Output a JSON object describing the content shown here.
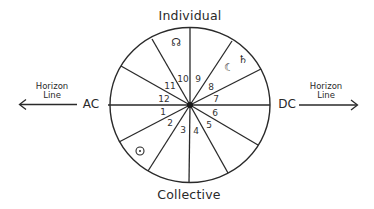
{
  "diagram": {
    "title_top": "Individual",
    "title_bottom": "Collective",
    "left": {
      "angle": "AC",
      "horizon_line1": "Horizon",
      "horizon_line2": "Line"
    },
    "right": {
      "angle": "DC",
      "horizon_line1": "Horizon",
      "horizon_line2": "Line"
    },
    "colors": {
      "stroke": "#2a2a2a",
      "text": "#2a2a2a",
      "background": "#ffffff"
    },
    "circle": {
      "cx": 190,
      "cy": 105,
      "rx": 80,
      "ry": 77.5
    },
    "spokes": [
      {
        "x": 108,
        "y": 105
      },
      {
        "x": 121,
        "y": 66
      },
      {
        "x": 152,
        "y": 39
      },
      {
        "x": 190,
        "y": 28
      },
      {
        "x": 232,
        "y": 41
      },
      {
        "x": 261,
        "y": 69
      },
      {
        "x": 270,
        "y": 105
      },
      {
        "x": 258,
        "y": 145
      },
      {
        "x": 228,
        "y": 173
      },
      {
        "x": 189,
        "y": 183
      },
      {
        "x": 148,
        "y": 171
      },
      {
        "x": 119,
        "y": 142
      }
    ],
    "houses": [
      {
        "num": "1",
        "x": 163,
        "y": 112
      },
      {
        "num": "2",
        "x": 170,
        "y": 123
      },
      {
        "num": "3",
        "x": 183,
        "y": 130
      },
      {
        "num": "4",
        "x": 196,
        "y": 131
      },
      {
        "num": "5",
        "x": 209,
        "y": 125
      },
      {
        "num": "6",
        "x": 215,
        "y": 113
      },
      {
        "num": "7",
        "x": 216,
        "y": 99
      },
      {
        "num": "8",
        "x": 211,
        "y": 87
      },
      {
        "num": "9",
        "x": 198,
        "y": 79
      },
      {
        "num": "10",
        "x": 183,
        "y": 79
      },
      {
        "num": "11",
        "x": 170,
        "y": 86
      },
      {
        "num": "12",
        "x": 164,
        "y": 99
      }
    ],
    "planets": [
      {
        "name": "north-node",
        "glyph": "☊",
        "house": "10",
        "x": 176,
        "y": 42
      },
      {
        "name": "moon",
        "glyph": "☾",
        "house": "8",
        "x": 229,
        "y": 67
      },
      {
        "name": "saturn",
        "glyph": "♄",
        "house": "8",
        "x": 243,
        "y": 59
      },
      {
        "name": "sun",
        "glyph": "☉",
        "house": "2",
        "x": 140,
        "y": 151
      }
    ]
  }
}
